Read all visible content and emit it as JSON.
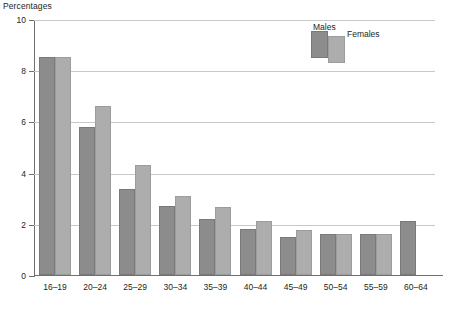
{
  "chart_data": {
    "type": "bar",
    "title": "Percentages",
    "xlabel": "",
    "ylabel": "Percentages",
    "ylim": [
      0,
      10
    ],
    "yticks": [
      0,
      2,
      4,
      6,
      8,
      10
    ],
    "grid": true,
    "legend_position": "top-right",
    "categories": [
      "16–19",
      "20–24",
      "25–29",
      "30–34",
      "35–39",
      "40–44",
      "45–49",
      "50–54",
      "55–59",
      "60–64"
    ],
    "series": [
      {
        "name": "Males",
        "color": "#8c8c8c",
        "values": [
          8.5,
          5.8,
          3.35,
          2.7,
          2.2,
          1.8,
          1.5,
          1.6,
          1.6,
          2.1
        ]
      },
      {
        "name": "Females",
        "color": "#adadad",
        "values": [
          8.5,
          6.6,
          4.3,
          3.1,
          2.65,
          2.1,
          1.75,
          1.6,
          1.6,
          null
        ]
      }
    ]
  },
  "legend": {
    "items": [
      {
        "label": "Males",
        "color": "#8c8c8c"
      },
      {
        "label": "Females",
        "color": "#adadad"
      }
    ]
  },
  "colors": {
    "males": "#8c8c8c",
    "females": "#adadad",
    "gridline": "#c8c8c8",
    "axis": "#6f6f6f",
    "text": "#231f20"
  }
}
